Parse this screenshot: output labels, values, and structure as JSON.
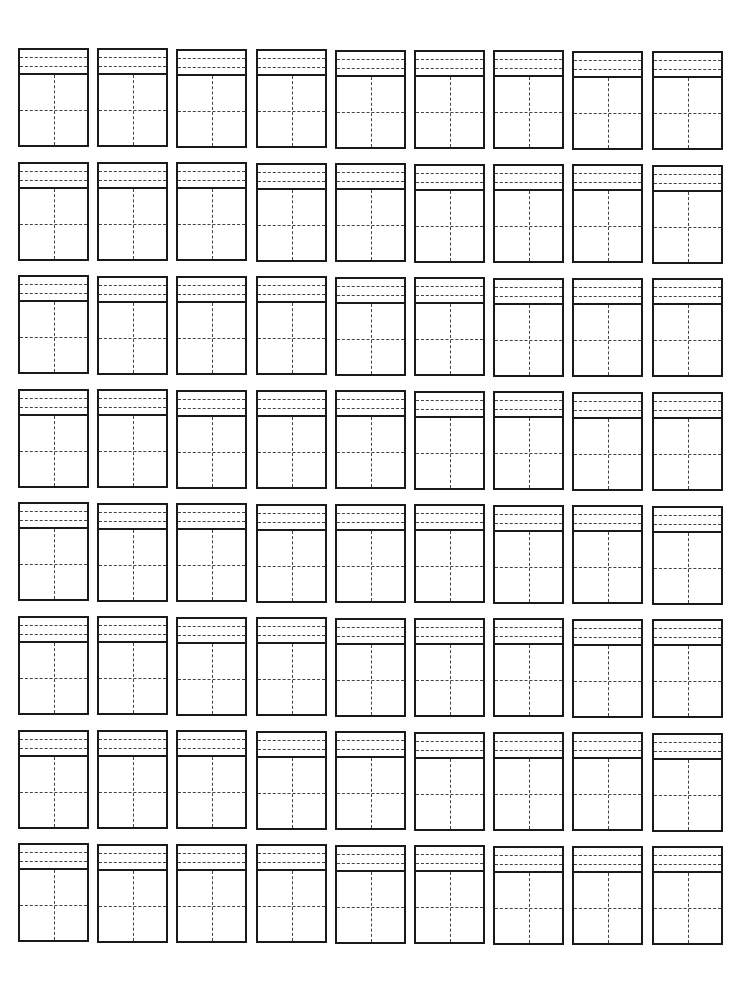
{
  "document": {
    "type": "chinese-character-practice-sheet",
    "grid": {
      "rows": 8,
      "columns": 9,
      "cell_style": "pinyin-header-with-tianzige",
      "pinyin_guide_lines": 2,
      "tian_divisions": "2x2-dashed"
    },
    "colors": {
      "line": "#1a1a1a",
      "guide": "#444444",
      "paper": "#ffffff"
    },
    "text": []
  }
}
